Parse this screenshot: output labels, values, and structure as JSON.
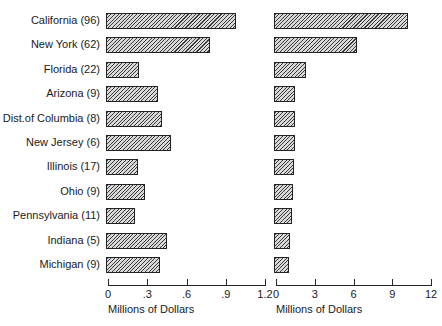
{
  "chart_data": [
    {
      "type": "bar",
      "orientation": "horizontal",
      "categories": [
        "California (96)",
        "New York (62)",
        "Florida (22)",
        "Arizona (9)",
        "Dist.of Columbia (8)",
        "New Jersey (6)",
        "Illinois (17)",
        "Ohio (9)",
        "Pennsylvania (11)",
        "Indiana (5)",
        "Michigan (9)"
      ],
      "values": [
        0.98,
        0.78,
        0.24,
        0.38,
        0.41,
        0.48,
        0.23,
        0.28,
        0.21,
        0.45,
        0.4
      ],
      "xlabel": "Millions of Dollars",
      "ylabel": "",
      "xlim": [
        0,
        1.2
      ],
      "xticks": [
        "0",
        ".3",
        ".6",
        ".9",
        "1.2"
      ],
      "grid": false,
      "legend": null
    },
    {
      "type": "bar",
      "orientation": "horizontal",
      "categories": [
        "California (96)",
        "New York (62)",
        "Florida (22)",
        "Arizona (9)",
        "Dist.of Columbia (8)",
        "New Jersey (6)",
        "Illinois (17)",
        "Ohio (9)",
        "Pennsylvania (11)",
        "Indiana (5)",
        "Michigan (9)"
      ],
      "values": [
        10.2,
        6.3,
        2.3,
        1.5,
        1.5,
        1.5,
        1.4,
        1.3,
        1.2,
        1.1,
        1.0
      ],
      "xlabel": "Millions of Dollars",
      "ylabel": "",
      "xlim": [
        0,
        12
      ],
      "xticks": [
        "0",
        "3",
        "6",
        "9",
        "12"
      ],
      "grid": false,
      "legend": null
    }
  ],
  "labels": [
    "California (96)",
    "New York (62)",
    "Florida (22)",
    "Arizona (9)",
    "Dist.of Columbia (8)",
    "New Jersey (6)",
    "Illinois (17)",
    "Ohio (9)",
    "Pennsylvania (11)",
    "Indiana (5)",
    "Michigan (9)"
  ],
  "left_axis": {
    "ticks": [
      "0",
      ".3",
      ".6",
      ".9",
      "1.2"
    ],
    "title": "Millions of Dollars"
  },
  "right_axis": {
    "ticks": [
      "0",
      "3",
      "6",
      "9",
      "12"
    ],
    "title": "Millions of Dollars"
  }
}
